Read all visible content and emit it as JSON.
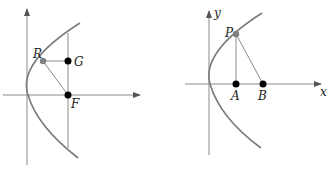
{
  "colors": {
    "line": "#8a8a8a",
    "curve": "#7a7a7a",
    "point_dark": "#000000",
    "point_gray": "#808080"
  },
  "left_diagram": {
    "points": {
      "R": {
        "label": "R",
        "style": "gray"
      },
      "G": {
        "label": "G",
        "style": "black"
      },
      "F": {
        "label": "F",
        "style": "black"
      }
    }
  },
  "right_diagram": {
    "axes": {
      "x_label": "x",
      "y_label": "y"
    },
    "points": {
      "P": {
        "label": "P",
        "style": "gray"
      },
      "A": {
        "label": "A",
        "style": "black"
      },
      "B": {
        "label": "B",
        "style": "black"
      }
    }
  }
}
